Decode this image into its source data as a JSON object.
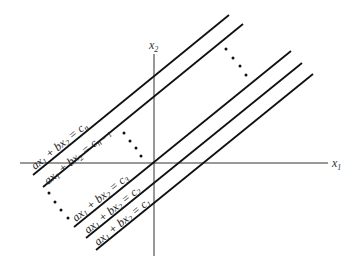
{
  "diagram": {
    "type": "parallel-lines-in-plane",
    "axes": {
      "x_label": "x",
      "x_sub": "1",
      "y_label": "x",
      "y_sub": "2"
    },
    "lines": [
      {
        "id": "cn",
        "lhs": "ax",
        "s1": "1",
        "mid": " + bx",
        "s2": "2",
        "rhs": " = c",
        "rs": "n",
        "x1": 33,
        "y1": 175,
        "x2": 229,
        "y2": 15
      },
      {
        "id": "cn1",
        "lhs": "ax",
        "s1": "1",
        "mid": " + bx",
        "s2": "2",
        "rhs": " = c",
        "rs": "n − 1",
        "x1": 43,
        "y1": 187,
        "x2": 243,
        "y2": 24
      },
      {
        "id": "c3",
        "lhs": "ax",
        "s1": "1",
        "mid": " + bx",
        "s2": "2",
        "rhs": " = c",
        "rs": "3",
        "x1": 74,
        "y1": 227,
        "x2": 291,
        "y2": 51
      },
      {
        "id": "c2",
        "lhs": "ax",
        "s1": "1",
        "mid": " + bx",
        "s2": "2",
        "rhs": " = c",
        "rs": "2",
        "x1": 86,
        "y1": 238,
        "x2": 302,
        "y2": 63
      },
      {
        "id": "c1",
        "lhs": "ax",
        "s1": "1",
        "mid": " + bx",
        "s2": "2",
        "rhs": " = c",
        "rs": "1",
        "x1": 96,
        "y1": 250,
        "x2": 313,
        "y2": 74
      }
    ],
    "ellipses": [
      "upper-right",
      "middle",
      "lower-left"
    ]
  }
}
